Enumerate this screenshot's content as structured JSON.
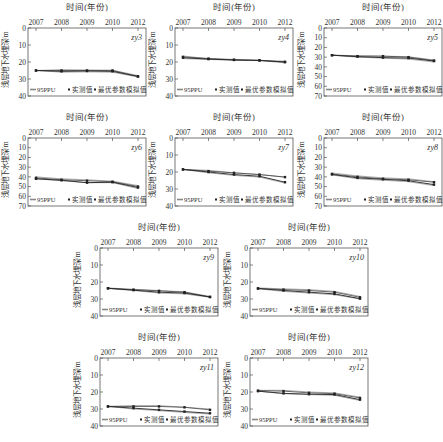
{
  "figure": {
    "x_title": "时间(年份)",
    "y_title": "浅层地下水埋深/m",
    "legend": {
      "ppu": "95PPU",
      "observed": "实测值",
      "simulated": "最优参数模拟值"
    }
  },
  "chart_data": [
    {
      "type": "line",
      "title": "zy3",
      "xlabel": "时间(年份)",
      "ylabel": "浅层地下水埋深/m",
      "categories": [
        "2007",
        "2008",
        "2009",
        "2010",
        "2012"
      ],
      "yticks": [
        0,
        10,
        20,
        30,
        40
      ],
      "ylim": [
        0,
        40
      ],
      "y_inverted": true,
      "series": [
        {
          "name": "95PPU_upper",
          "values": [
            25,
            24.5,
            24.7,
            24.8,
            28
          ]
        },
        {
          "name": "95PPU_lower",
          "values": [
            25,
            26,
            25.8,
            26,
            28.8
          ]
        },
        {
          "name": "实测值",
          "values": [
            25,
            25,
            25,
            25,
            28.5
          ]
        },
        {
          "name": "最优参数模拟值",
          "values": [
            25,
            25.5,
            25.3,
            25.5,
            28.5
          ]
        }
      ]
    },
    {
      "type": "line",
      "title": "zy4",
      "xlabel": "时间(年份)",
      "ylabel": "浅层地下水埋深/m",
      "categories": [
        "2007",
        "2008",
        "2009",
        "2010",
        "2012"
      ],
      "yticks": [
        0,
        10,
        20,
        30,
        40
      ],
      "ylim": [
        0,
        40
      ],
      "y_inverted": true,
      "series": [
        {
          "name": "95PPU_upper",
          "values": [
            16.5,
            18,
            18.5,
            19,
            19.5
          ]
        },
        {
          "name": "95PPU_lower",
          "values": [
            18,
            18.5,
            19,
            19.2,
            20.5
          ]
        },
        {
          "name": "实测值",
          "values": [
            17,
            18,
            18.7,
            19,
            20
          ]
        },
        {
          "name": "最优参数模拟值",
          "values": [
            17.5,
            18.3,
            18.8,
            19.1,
            20
          ]
        }
      ]
    },
    {
      "type": "line",
      "title": "zy5",
      "xlabel": "时间(年份)",
      "ylabel": "浅层地下水埋深/m",
      "categories": [
        "2007",
        "2008",
        "2009",
        "2010",
        "2012"
      ],
      "yticks": [
        0,
        10,
        20,
        30,
        40,
        50,
        60,
        70
      ],
      "ylim": [
        0,
        70
      ],
      "y_inverted": true,
      "series": [
        {
          "name": "95PPU_upper",
          "values": [
            28,
            28.5,
            29,
            29.5,
            33
          ]
        },
        {
          "name": "95PPU_lower",
          "values": [
            28,
            30,
            31,
            32,
            35
          ]
        },
        {
          "name": "实测值",
          "values": [
            28,
            29,
            29,
            30,
            33.5
          ]
        },
        {
          "name": "最优参数模拟值",
          "values": [
            28,
            29.5,
            30.5,
            31,
            34
          ]
        }
      ]
    },
    {
      "type": "line",
      "title": "zy6",
      "xlabel": "时间(年份)",
      "ylabel": "浅层地下水埋深/m",
      "categories": [
        "2007",
        "2008",
        "2009",
        "2010",
        "2012"
      ],
      "yticks": [
        0,
        10,
        20,
        30,
        40,
        50,
        60,
        70
      ],
      "ylim": [
        0,
        70
      ],
      "y_inverted": true,
      "series": [
        {
          "name": "95PPU_upper",
          "values": [
            40,
            42,
            43,
            44.5,
            49
          ]
        },
        {
          "name": "95PPU_lower",
          "values": [
            42,
            44,
            46,
            46,
            52
          ]
        },
        {
          "name": "实测值",
          "values": [
            41,
            43,
            44,
            45,
            50
          ]
        },
        {
          "name": "最优参数模拟值",
          "values": [
            42,
            43.5,
            46,
            45.5,
            51
          ]
        }
      ]
    },
    {
      "type": "line",
      "title": "zy7",
      "xlabel": "时间(年份)",
      "ylabel": "浅层地下水埋深/m",
      "categories": [
        "2007",
        "2008",
        "2009",
        "2010",
        "2012"
      ],
      "yticks": [
        0,
        10,
        20,
        30,
        40
      ],
      "ylim": [
        0,
        40
      ],
      "y_inverted": true,
      "series": [
        {
          "name": "95PPU_upper",
          "values": [
            18.5,
            19,
            20.5,
            21.5,
            23
          ]
        },
        {
          "name": "95PPU_lower",
          "values": [
            18.5,
            20.5,
            22,
            23,
            26.5
          ]
        },
        {
          "name": "实测值",
          "values": [
            18.5,
            19.5,
            20.5,
            21.5,
            23
          ]
        },
        {
          "name": "最优参数模拟值",
          "values": [
            18.5,
            20,
            21.5,
            22.5,
            26
          ]
        }
      ]
    },
    {
      "type": "line",
      "title": "zy8",
      "xlabel": "时间(年份)",
      "ylabel": "浅层地下水埋深/m",
      "categories": [
        "2007",
        "2008",
        "2009",
        "2010",
        "2012"
      ],
      "yticks": [
        0,
        10,
        20,
        30,
        40,
        50,
        60,
        70
      ],
      "ylim": [
        0,
        70
      ],
      "y_inverted": true,
      "series": [
        {
          "name": "95PPU_upper",
          "values": [
            36,
            39,
            41,
            42,
            45
          ]
        },
        {
          "name": "95PPU_lower",
          "values": [
            38,
            42,
            43.5,
            45,
            49
          ]
        },
        {
          "name": "实测值",
          "values": [
            37,
            40,
            42,
            43,
            45.5
          ]
        },
        {
          "name": "最优参数模拟值",
          "values": [
            37.5,
            41,
            42.5,
            44,
            48
          ]
        }
      ]
    },
    {
      "type": "line",
      "title": "zy9",
      "xlabel": "时间(年份)",
      "ylabel": "浅层地下水埋深/m",
      "categories": [
        "2007",
        "2008",
        "2009",
        "2010",
        "2012"
      ],
      "yticks": [
        0,
        10,
        20,
        30,
        40
      ],
      "ylim": [
        0,
        40
      ],
      "y_inverted": true,
      "series": [
        {
          "name": "95PPU_upper",
          "values": [
            23.5,
            24.3,
            25,
            25.8,
            28.5
          ]
        },
        {
          "name": "95PPU_lower",
          "values": [
            23.8,
            25,
            26.5,
            27,
            29
          ]
        },
        {
          "name": "实测值",
          "values": [
            23.7,
            24.5,
            25.2,
            26,
            28.8
          ]
        },
        {
          "name": "最优参数模拟值",
          "values": [
            23.7,
            24.8,
            26,
            26.5,
            28.8
          ]
        }
      ]
    },
    {
      "type": "line",
      "title": "zy10",
      "xlabel": "时间(年份)",
      "ylabel": "浅层地下水埋深/m",
      "categories": [
        "2007",
        "2008",
        "2009",
        "2010",
        "2012"
      ],
      "yticks": [
        0,
        10,
        20,
        30,
        40
      ],
      "ylim": [
        0,
        40
      ],
      "y_inverted": true,
      "series": [
        {
          "name": "95PPU_upper",
          "values": [
            23.5,
            24,
            24.5,
            25.5,
            28.5
          ]
        },
        {
          "name": "95PPU_lower",
          "values": [
            24,
            25.5,
            26.5,
            27.5,
            30
          ]
        },
        {
          "name": "实测值",
          "values": [
            23.8,
            24.5,
            25,
            26,
            29
          ]
        },
        {
          "name": "最优参数模拟值",
          "values": [
            23.8,
            25,
            26,
            27,
            29.8
          ]
        }
      ]
    },
    {
      "type": "line",
      "title": "zy11",
      "xlabel": "时间(年份)",
      "ylabel": "浅层地下水埋深/m",
      "categories": [
        "2007",
        "2008",
        "2009",
        "2010",
        "2012"
      ],
      "yticks": [
        0,
        10,
        20,
        30,
        40
      ],
      "ylim": [
        0,
        40
      ],
      "y_inverted": true,
      "series": [
        {
          "name": "95PPU_upper",
          "values": [
            28.5,
            28,
            28,
            29,
            30
          ]
        },
        {
          "name": "95PPU_lower",
          "values": [
            28.5,
            30,
            31,
            32,
            33
          ]
        },
        {
          "name": "实测值",
          "values": [
            28.5,
            28.5,
            28.5,
            29,
            30.5
          ]
        },
        {
          "name": "最优参数模拟值",
          "values": [
            28.5,
            29.5,
            30.5,
            31.5,
            32.5
          ]
        }
      ]
    },
    {
      "type": "line",
      "title": "zy12",
      "xlabel": "时间(年份)",
      "ylabel": "浅层地下水埋深/m",
      "categories": [
        "2007",
        "2008",
        "2009",
        "2010",
        "2012"
      ],
      "yticks": [
        0,
        10,
        20,
        30,
        40
      ],
      "ylim": [
        0,
        40
      ],
      "y_inverted": true,
      "series": [
        {
          "name": "95PPU_upper",
          "values": [
            19,
            19,
            20,
            20.5,
            23
          ]
        },
        {
          "name": "95PPU_lower",
          "values": [
            19.5,
            21,
            21.5,
            22,
            25
          ]
        },
        {
          "name": "实测值",
          "values": [
            19.2,
            19.5,
            20.5,
            21,
            23.5
          ]
        },
        {
          "name": "最优参数模拟值",
          "values": [
            19.5,
            20.8,
            21.3,
            21.5,
            24.5
          ]
        }
      ]
    }
  ],
  "layout": {
    "panels": [
      {
        "left": 0,
        "top": 0
      },
      {
        "left": 147,
        "top": 0
      },
      {
        "left": 296,
        "top": 0
      },
      {
        "left": 0,
        "top": 110
      },
      {
        "left": 147,
        "top": 110
      },
      {
        "left": 296,
        "top": 110
      },
      {
        "left": 72,
        "top": 220
      },
      {
        "left": 222,
        "top": 220
      },
      {
        "left": 72,
        "top": 330
      },
      {
        "left": 222,
        "top": 330
      }
    ]
  }
}
